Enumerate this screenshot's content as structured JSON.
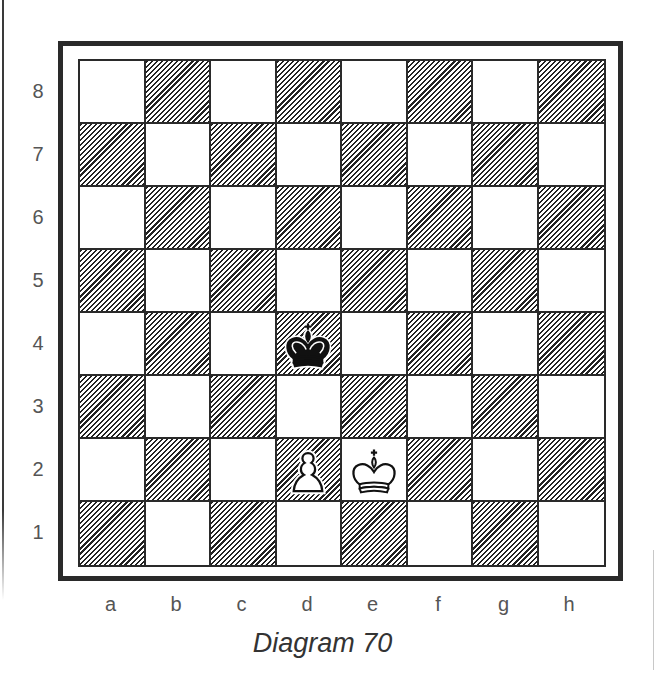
{
  "caption": "Diagram 70",
  "board": {
    "ranks": [
      "8",
      "7",
      "6",
      "5",
      "4",
      "3",
      "2",
      "1"
    ],
    "files": [
      "a",
      "b",
      "c",
      "d",
      "e",
      "f",
      "g",
      "h"
    ],
    "light_color": "#ffffff",
    "dark_style": "diagonal-hatch",
    "line_color": "#2a2a2a"
  },
  "pieces": [
    {
      "square": "d4",
      "color": "black",
      "type": "king"
    },
    {
      "square": "d2",
      "color": "white",
      "type": "pawn"
    },
    {
      "square": "e2",
      "color": "white",
      "type": "king"
    }
  ]
}
